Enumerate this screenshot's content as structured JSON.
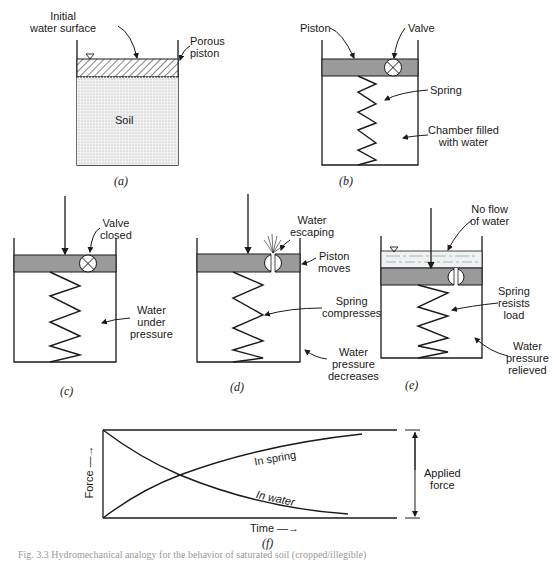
{
  "panels": {
    "a": {
      "caption": "(a)",
      "labels": {
        "initial_water_surface_1": "Initial",
        "initial_water_surface_2": "water surface",
        "porous_piston_1": "Porous",
        "porous_piston_2": "piston",
        "soil": "Soil"
      }
    },
    "b": {
      "caption": "(b)",
      "labels": {
        "piston": "Piston",
        "valve": "Valve",
        "spring": "Spring",
        "chamber_1": "Chamber filled",
        "chamber_2": "with water"
      }
    },
    "c": {
      "caption": "(c)",
      "labels": {
        "valve_1": "Valve",
        "valve_2": "closed",
        "water_1": "Water",
        "water_2": "under",
        "water_3": "pressure"
      }
    },
    "d": {
      "caption": "(d)",
      "labels": {
        "escaping_1": "Water",
        "escaping_2": "escaping",
        "piston_1": "Piston",
        "piston_2": "moves",
        "spring_1": "Spring",
        "spring_2": "compresses",
        "water_1": "Water",
        "water_2": "pressure",
        "water_3": "decreases"
      }
    },
    "e": {
      "caption": "(e)",
      "labels": {
        "noflow_1": "No flow",
        "noflow_2": "of water",
        "spring_1": "Spring",
        "spring_2": "resists",
        "spring_3": "load",
        "water_1": "Water",
        "water_2": "pressure",
        "water_3": "relieved"
      }
    },
    "f": {
      "caption": "(f)",
      "labels": {
        "y_axis": "Force —→",
        "x_axis": "Time —→",
        "in_spring": "In spring",
        "in_water": "In water",
        "applied_1": "Applied",
        "applied_2": "force"
      }
    }
  },
  "figure_caption": "Fig. 3.3  Hydromechanical analogy for the behavior of saturated soil (cropped/illegible)",
  "colors": {
    "ink": "#1a1a1a",
    "piston_fill": "#9a9a9a",
    "soil_fill": "#e6e6e6",
    "water_fill": "#eef2f2"
  }
}
